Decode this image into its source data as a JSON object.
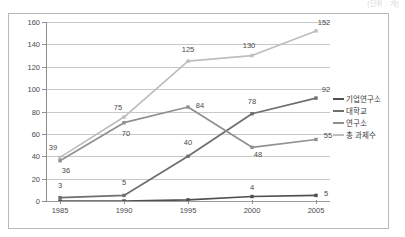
{
  "caption": "(단위 : 개)",
  "chart_data": {
    "type": "line",
    "title": "",
    "xlabel": "",
    "ylabel": "",
    "categories": [
      "1985",
      "1990",
      "1995",
      "2000",
      "2005"
    ],
    "ylim": [
      0,
      160
    ],
    "yticks": [
      0,
      20,
      40,
      60,
      80,
      100,
      120,
      140,
      160
    ],
    "grid": true,
    "legend_position": "right",
    "series": [
      {
        "name": "기업연구소",
        "color": "#4f4f4f",
        "values": [
          0,
          0,
          1,
          4,
          5
        ],
        "labels": [
          "",
          "",
          "",
          "4",
          "5"
        ]
      },
      {
        "name": "대학교",
        "color": "#6e6e6e",
        "values": [
          3,
          5,
          40,
          78,
          92
        ],
        "labels": [
          "3",
          "5",
          "40",
          "78",
          "92"
        ]
      },
      {
        "name": "연구소",
        "color": "#909090",
        "values": [
          36,
          70,
          84,
          48,
          55
        ],
        "labels": [
          "36",
          "70",
          "84",
          "48",
          "55"
        ]
      },
      {
        "name": "총 과제수",
        "color": "#bdbdbd",
        "values": [
          39,
          75,
          125,
          130,
          152
        ],
        "labels": [
          "39",
          "75",
          "125",
          "130",
          "152"
        ]
      }
    ]
  }
}
